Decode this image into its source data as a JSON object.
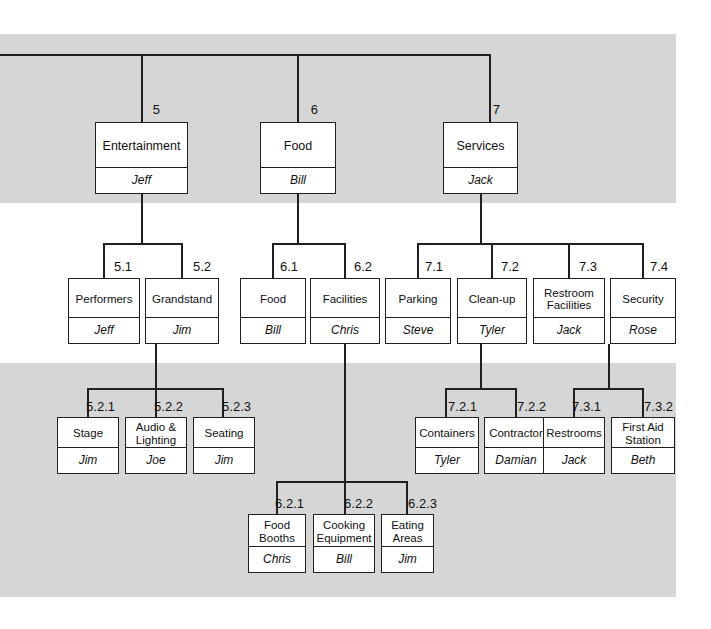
{
  "diagram": {
    "type": "work-breakdown-structure",
    "colors": {
      "band": "#d6d6d6",
      "line": "#231f20",
      "box_fill": "#ffffff",
      "text": "#111111"
    },
    "bands": [
      {
        "top": 34,
        "height": 169
      },
      {
        "top": 363,
        "height": 134
      },
      {
        "top": 497,
        "height": 100
      }
    ]
  },
  "nodes": [
    {
      "id": "5",
      "code": "5",
      "title": "Entertainment",
      "owner": "Jeff",
      "x": 95,
      "y": 122,
      "w": 93,
      "h": 72,
      "code_x": 160,
      "code_y": 103
    },
    {
      "id": "6",
      "code": "6",
      "title": "Food",
      "owner": "Bill",
      "x": 260,
      "y": 122,
      "w": 76,
      "h": 72,
      "code_x": 318,
      "code_y": 103
    },
    {
      "id": "7",
      "code": "7",
      "title": "Services",
      "owner": "Jack",
      "x": 443,
      "y": 122,
      "w": 75,
      "h": 72,
      "code_x": 500,
      "code_y": 103
    },
    {
      "id": "5.1",
      "code": "5.1",
      "title": "Performers",
      "owner": "Jeff",
      "x": 68,
      "y": 278,
      "w": 72,
      "h": 66,
      "code_x": 132,
      "code_y": 260
    },
    {
      "id": "5.2",
      "code": "5.2",
      "title": "Grandstand",
      "owner": "Jim",
      "x": 145,
      "y": 278,
      "w": 74,
      "h": 66,
      "code_x": 211,
      "code_y": 260
    },
    {
      "id": "6.1",
      "code": "6.1",
      "title": "Food",
      "owner": "Bill",
      "x": 240,
      "y": 278,
      "w": 66,
      "h": 66,
      "code_x": 298,
      "code_y": 260
    },
    {
      "id": "6.2",
      "code": "6.2",
      "title": "Facilities",
      "owner": "Chris",
      "x": 310,
      "y": 278,
      "w": 70,
      "h": 66,
      "code_x": 372,
      "code_y": 260
    },
    {
      "id": "7.1",
      "code": "7.1",
      "title": "Parking",
      "owner": "Steve",
      "x": 385,
      "y": 278,
      "w": 66,
      "h": 66,
      "code_x": 443,
      "code_y": 260
    },
    {
      "id": "7.2",
      "code": "7.2",
      "title": "Clean-up",
      "owner": "Tyler",
      "x": 457,
      "y": 278,
      "w": 70,
      "h": 66,
      "code_x": 519,
      "code_y": 260
    },
    {
      "id": "7.3",
      "code": "7.3",
      "title": "Restroom\nFacilities",
      "owner": "Jack",
      "x": 533,
      "y": 278,
      "w": 72,
      "h": 66,
      "code_x": 597,
      "code_y": 260
    },
    {
      "id": "7.4",
      "code": "7.4",
      "title": "Security",
      "owner": "Rose",
      "x": 610,
      "y": 278,
      "w": 66,
      "h": 66,
      "code_x": 668,
      "code_y": 260
    },
    {
      "id": "5.2.1",
      "code": "5.2.1",
      "title": "Stage",
      "owner": "Jim",
      "x": 57,
      "y": 417,
      "w": 62,
      "h": 57,
      "code_x": 115,
      "code_y": 400
    },
    {
      "id": "5.2.2",
      "code": "5.2.2",
      "title": "Audio &\nLighting",
      "owner": "Joe",
      "x": 125,
      "y": 417,
      "w": 62,
      "h": 57,
      "code_x": 183,
      "code_y": 400
    },
    {
      "id": "5.2.3",
      "code": "5.2.3",
      "title": "Seating",
      "owner": "Jim",
      "x": 193,
      "y": 417,
      "w": 62,
      "h": 57,
      "code_x": 251,
      "code_y": 400
    },
    {
      "id": "7.2.1",
      "code": "7.2.1",
      "title": "Containers",
      "owner": "Tyler",
      "x": 415,
      "y": 417,
      "w": 64,
      "h": 57,
      "code_x": 477,
      "code_y": 400
    },
    {
      "id": "7.2.2",
      "code": "7.2.2",
      "title": "Contractor",
      "owner": "Damian",
      "x": 484,
      "y": 417,
      "w": 64,
      "h": 57,
      "code_x": 546,
      "code_y": 400
    },
    {
      "id": "7.3.1",
      "code": "7.3.1",
      "title": "Restrooms",
      "owner": "Jack",
      "x": 543,
      "y": 417,
      "w": 62,
      "h": 57,
      "code_x": 601,
      "code_y": 400
    },
    {
      "id": "7.3.2",
      "code": "7.3.2",
      "title": "First Aid\nStation",
      "owner": "Beth",
      "x": 611,
      "y": 417,
      "w": 64,
      "h": 57,
      "code_x": 673,
      "code_y": 400
    },
    {
      "id": "6.2.1",
      "code": "6.2.1",
      "title": "Food\nBooths",
      "owner": "Chris",
      "x": 248,
      "y": 514,
      "w": 58,
      "h": 59,
      "code_x": 304,
      "code_y": 497
    },
    {
      "id": "6.2.2",
      "code": "6.2.2",
      "title": "Cooking\nEquipment",
      "owner": "Bill",
      "x": 313,
      "y": 514,
      "w": 62,
      "h": 59,
      "code_x": 373,
      "code_y": 497
    },
    {
      "id": "6.2.3",
      "code": "6.2.3",
      "title": "Eating\nAreas",
      "owner": "Jim",
      "x": 381,
      "y": 514,
      "w": 53,
      "h": 59,
      "code_x": 437,
      "code_y": 497
    }
  ],
  "lines": {
    "horizontal": [
      {
        "name": "root-bus",
        "x": 0,
        "y": 54,
        "w": 490
      },
      {
        "name": "level5-bus",
        "x": 103,
        "y": 243,
        "w": 79
      },
      {
        "name": "level6-bus",
        "x": 272,
        "y": 243,
        "w": 73
      },
      {
        "name": "level7-bus",
        "x": 417,
        "y": 243,
        "w": 226
      },
      {
        "name": "level52-bus",
        "x": 87,
        "y": 388,
        "w": 136
      },
      {
        "name": "level72-bus",
        "x": 445,
        "y": 388,
        "w": 71
      },
      {
        "name": "level73-bus",
        "x": 573,
        "y": 388,
        "w": 70
      },
      {
        "name": "level62-bus",
        "x": 276,
        "y": 481,
        "w": 131
      }
    ],
    "vertical": [
      {
        "name": "drop-to-5",
        "x": 141,
        "y": 54,
        "h": 68
      },
      {
        "name": "drop-to-6",
        "x": 297,
        "y": 54,
        "h": 68
      },
      {
        "name": "drop-to-7",
        "x": 489,
        "y": 54,
        "h": 68
      },
      {
        "name": "stem-5",
        "x": 141,
        "y": 194,
        "h": 49
      },
      {
        "name": "stem-6",
        "x": 297,
        "y": 194,
        "h": 49
      },
      {
        "name": "stem-7",
        "x": 480,
        "y": 194,
        "h": 49
      },
      {
        "name": "drop-to-5.1",
        "x": 103,
        "y": 243,
        "h": 35
      },
      {
        "name": "drop-to-5.2",
        "x": 181,
        "y": 243,
        "h": 35
      },
      {
        "name": "drop-to-6.1",
        "x": 272,
        "y": 243,
        "h": 35
      },
      {
        "name": "drop-to-6.2",
        "x": 344,
        "y": 243,
        "h": 35
      },
      {
        "name": "drop-to-7.1",
        "x": 417,
        "y": 243,
        "h": 35
      },
      {
        "name": "drop-to-7.2",
        "x": 491,
        "y": 243,
        "h": 35
      },
      {
        "name": "drop-to-7.3",
        "x": 568,
        "y": 243,
        "h": 35
      },
      {
        "name": "drop-to-7.4",
        "x": 642,
        "y": 243,
        "h": 35
      },
      {
        "name": "stem-5.2",
        "x": 155,
        "y": 344,
        "h": 44
      },
      {
        "name": "stem-7.2",
        "x": 480,
        "y": 344,
        "h": 44
      },
      {
        "name": "stem-7.3",
        "x": 608,
        "y": 344,
        "h": 44
      },
      {
        "name": "drop-to-5.2.1",
        "x": 87,
        "y": 388,
        "h": 29
      },
      {
        "name": "drop-to-5.2.2",
        "x": 155,
        "y": 388,
        "h": 29
      },
      {
        "name": "drop-to-5.2.3",
        "x": 222,
        "y": 388,
        "h": 29
      },
      {
        "name": "drop-to-7.2.1",
        "x": 445,
        "y": 388,
        "h": 29
      },
      {
        "name": "drop-to-7.2.2",
        "x": 515,
        "y": 388,
        "h": 29
      },
      {
        "name": "drop-to-7.3.1",
        "x": 573,
        "y": 388,
        "h": 29
      },
      {
        "name": "drop-to-7.3.2",
        "x": 642,
        "y": 388,
        "h": 29
      },
      {
        "name": "stem-6.2-long",
        "x": 344,
        "y": 344,
        "h": 137
      },
      {
        "name": "drop-to-6.2.1",
        "x": 276,
        "y": 481,
        "h": 33
      },
      {
        "name": "drop-to-6.2.2",
        "x": 344,
        "y": 481,
        "h": 33
      },
      {
        "name": "drop-to-6.2.3",
        "x": 406,
        "y": 481,
        "h": 33
      }
    ]
  }
}
